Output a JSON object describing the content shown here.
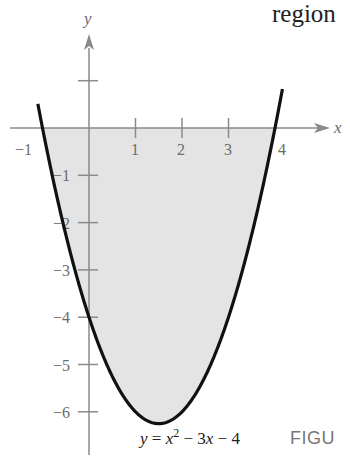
{
  "header_fragment": "region",
  "figure_caption_fragment": "FIGU",
  "chart_data": {
    "type": "line",
    "title": "",
    "equation": "y = x^2 - 3x - 4",
    "equation_parts": {
      "y": "y",
      "eq": " = ",
      "x1": "x",
      "sup": "2",
      "mid": " − 3",
      "x2": "x",
      "end": " − 4"
    },
    "xlabel": "x",
    "ylabel": "y",
    "xlim": [
      -1.1,
      5.2
    ],
    "ylim": [
      -6.8,
      2.2
    ],
    "x_ticks": [
      1,
      2,
      3,
      4
    ],
    "x_tick_labels": [
      "−1",
      "1",
      "2",
      "3",
      "4"
    ],
    "y_ticks": [
      1,
      -1,
      -2,
      -3,
      -4,
      -5,
      -6
    ],
    "y_tick_labels": [
      "−1",
      "−2",
      "−3",
      "−4",
      "−5",
      "−6"
    ],
    "grid": false,
    "shaded_region": {
      "description": "region between curve and x-axis from x=-1 to x=4",
      "x_range": [
        -1,
        4
      ],
      "color": "#e4e4e4"
    },
    "series": [
      {
        "name": "y = x^2 - 3x - 4",
        "x": [
          -1.1,
          -1,
          -0.5,
          0,
          0.5,
          1,
          1.5,
          2,
          2.5,
          3,
          3.5,
          4,
          4.15
        ],
        "values": [
          -0.49,
          0,
          -2.25,
          -4,
          -5.25,
          -6,
          -6.25,
          -6,
          -5.25,
          -4,
          -2.25,
          0,
          0.77
        ]
      }
    ],
    "key_points": {
      "x_intercepts": [
        -1,
        4
      ],
      "y_intercept": -4,
      "vertex": [
        1.5,
        -6.25
      ]
    }
  },
  "colors": {
    "axis": "#8a8a8a",
    "curve": "#111111",
    "fill": "#e4e4e4",
    "label": "#6b6b6b"
  }
}
